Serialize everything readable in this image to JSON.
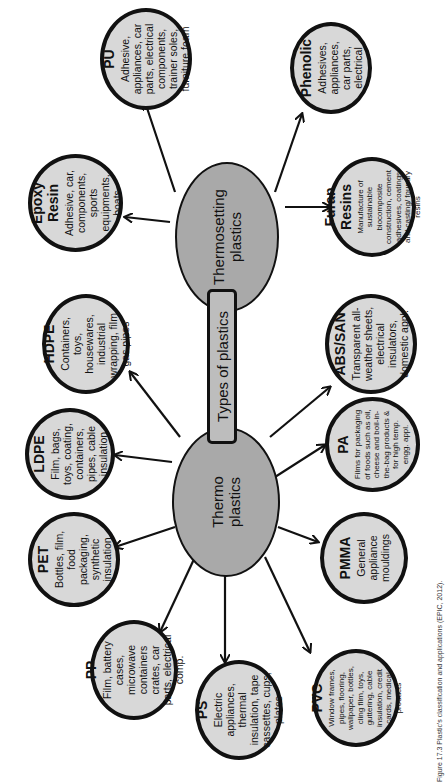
{
  "center": {
    "label": "Types of plastics"
  },
  "groups": {
    "thermo": {
      "line1": "Thermo",
      "line2": "plastics"
    },
    "thermosetting": {
      "line1": "Thermosetting",
      "line2": "plastics"
    }
  },
  "thermoplastics": [
    {
      "name": "HDPE",
      "uses": "Containers, toys, housewares, industrial wrapping, film, gas pipes"
    },
    {
      "name": "LDPE",
      "uses": "Film, bags, toys, coating, containers, pipes, cable insulation"
    },
    {
      "name": "PET",
      "uses": "Bottles, film, food packaging, synthetic insulation"
    },
    {
      "name": "PP",
      "uses": "Film, battery cases, microwave containers crates, car parts, electrical comp."
    },
    {
      "name": "PS",
      "uses": "Electric appliances, thermal insulation, tape cassettes, cups, plates"
    },
    {
      "name": "PVC",
      "uses": "Window frames, pipes, flooring, wallpaper, bottles, cling film, toys, guttering, cable insulation, credit cards, medical products"
    },
    {
      "name": "PMMA",
      "uses": "General appliance mouldings"
    },
    {
      "name": "PA",
      "uses": "Films for packaging of foods such as oil, cheese and boil-in-the-bag products & for high temp. engg. appl."
    },
    {
      "name": "ABS/SAN",
      "uses": "Transparent all-weather sheets, electrical insulators, domestic appl."
    }
  ],
  "thermosetting_plastics": [
    {
      "name": "PU",
      "uses": "Adhesive, appliances, car parts, electrical components, trainer soles, furniture foam"
    },
    {
      "name": "Epoxy Resin",
      "uses": "Adhesive, car, components, sports equipments, boats"
    },
    {
      "name": "Phenolic",
      "uses": "Adhesives, appliances, car parts, electrical"
    },
    {
      "name": "Furan Resins",
      "uses": "Manufacture of sustainable biocomposite construction, cement adhesives, coatings and casting/ foundry resins"
    }
  ],
  "caption": "Figure 17.3  Plastic's classification and applications (EPIC, 2012)."
}
